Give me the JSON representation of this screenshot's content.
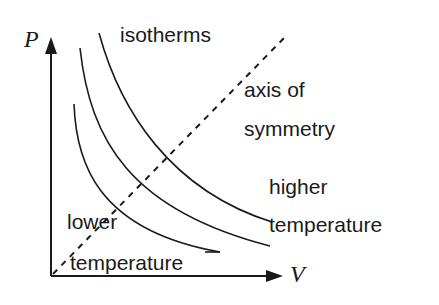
{
  "diagram": {
    "axes": {
      "y_label": "P",
      "x_label": "V"
    },
    "labels": {
      "isotherms": "isotherms",
      "axis_line1": "axis of",
      "axis_line2": "symmetry",
      "higher_line1": "higher",
      "higher_line2": "temperature",
      "lower_line1": "lower",
      "lower_line2": "temperature"
    },
    "colors": {
      "ink": "#1a1a1a",
      "background": "#ffffff"
    },
    "curves": [
      {
        "name": "lower-temperature-isotherm"
      },
      {
        "name": "middle-isotherm"
      },
      {
        "name": "higher-temperature-isotherm"
      }
    ]
  }
}
